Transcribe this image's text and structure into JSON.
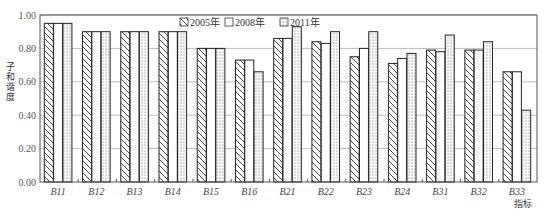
{
  "chart_data": {
    "type": "bar",
    "title": "",
    "xlabel": "指标",
    "ylabel": "子和谐度",
    "ylim": [
      0,
      1.0
    ],
    "yticks": [
      "0.00",
      "0.20",
      "0.40",
      "0.60",
      "0.80",
      "1.00"
    ],
    "grid": true,
    "legend_position": "top-center-inside",
    "categories": [
      "B11",
      "B12",
      "B13",
      "B14",
      "B15",
      "B16",
      "B21",
      "B22",
      "B23",
      "B24",
      "B31",
      "B32",
      "B33"
    ],
    "series": [
      {
        "name": "2005年",
        "pattern": "diagonal-hatch",
        "values": [
          0.95,
          0.9,
          0.9,
          0.9,
          0.8,
          0.73,
          0.86,
          0.84,
          0.75,
          0.71,
          0.79,
          0.79,
          0.66
        ]
      },
      {
        "name": "2008年",
        "pattern": "blank",
        "values": [
          0.95,
          0.9,
          0.9,
          0.9,
          0.8,
          0.73,
          0.86,
          0.83,
          0.8,
          0.74,
          0.78,
          0.79,
          0.66
        ]
      },
      {
        "name": "2011年",
        "pattern": "dotted",
        "values": [
          0.95,
          0.9,
          0.9,
          0.9,
          0.8,
          0.66,
          0.93,
          0.9,
          0.9,
          0.77,
          0.88,
          0.84,
          0.43
        ]
      }
    ]
  },
  "legend": {
    "items": [
      {
        "label": "2005年",
        "pattern": "diagonal-hatch"
      },
      {
        "label": "2008年",
        "pattern": "blank"
      },
      {
        "label": "2011年",
        "pattern": "dotted"
      }
    ]
  },
  "axes": {
    "ylabel": "子和谐度",
    "xlabel": "指标"
  },
  "colors": {
    "bar_stroke": "#222222",
    "grid": "#bbbbbb",
    "axis": "#555555",
    "background": "#ffffff"
  }
}
